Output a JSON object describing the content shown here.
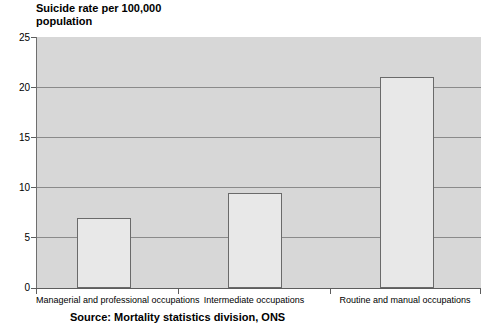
{
  "chart_data": {
    "type": "bar",
    "title": "Suicide rate per 100,000 population",
    "title_lines": [
      "Suicide rate per 100,000",
      "population"
    ],
    "xlabel": "",
    "ylabel": "",
    "categories": [
      "Managerial and professional occupations",
      "Intermediate occupations",
      "Routine and manual occupations"
    ],
    "values": [
      7.0,
      9.5,
      21.0
    ],
    "ylim": [
      0,
      25
    ],
    "ytick_step": 5,
    "ytick_labels": [
      "0",
      "5",
      "10",
      "15",
      "20",
      "25"
    ],
    "grid": true,
    "grid_axis": "y",
    "legend": "none",
    "source": "Source: Mortality statistics division, ONS",
    "colors": {
      "plot_background": "#d7d7d7",
      "bar_fill": "#e8e8e8",
      "bar_border": "#6a6a6a",
      "gridline": "#8a8a8a",
      "axis": "#5d5d5d",
      "text": "#000000",
      "page_background": "#ffffff"
    }
  }
}
